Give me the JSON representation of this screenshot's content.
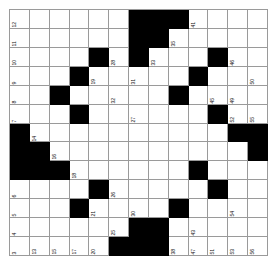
{
  "puzzle": {
    "title": "Crossword Grid",
    "rows": 13,
    "cols": 13,
    "colors": {
      "block": "#000000",
      "cell": "#ffffff",
      "gridline": "#9a9a9a",
      "number": "#111111",
      "background": "#ffffff"
    },
    "number_orientation": "rotated-90-ccw",
    "grid": [
      [
        "w",
        "w",
        "w",
        "w",
        "w",
        "w",
        "b",
        "b",
        "b",
        "w",
        "w",
        "w",
        "w"
      ],
      [
        "w",
        "w",
        "w",
        "w",
        "w",
        "w",
        "b",
        "b",
        "w",
        "w",
        "w",
        "w",
        "w"
      ],
      [
        "w",
        "w",
        "w",
        "w",
        "b",
        "w",
        "b",
        "w",
        "w",
        "w",
        "b",
        "w",
        "w"
      ],
      [
        "w",
        "w",
        "w",
        "b",
        "w",
        "w",
        "w",
        "w",
        "w",
        "b",
        "w",
        "w",
        "w"
      ],
      [
        "w",
        "w",
        "b",
        "w",
        "w",
        "w",
        "w",
        "w",
        "b",
        "w",
        "w",
        "w",
        "w"
      ],
      [
        "w",
        "w",
        "w",
        "b",
        "w",
        "w",
        "w",
        "w",
        "w",
        "w",
        "b",
        "w",
        "w"
      ],
      [
        "b",
        "w",
        "w",
        "w",
        "w",
        "w",
        "w",
        "w",
        "w",
        "w",
        "w",
        "b",
        "b"
      ],
      [
        "b",
        "b",
        "w",
        "w",
        "w",
        "w",
        "w",
        "w",
        "w",
        "w",
        "w",
        "w",
        "b"
      ],
      [
        "b",
        "b",
        "b",
        "w",
        "w",
        "w",
        "w",
        "w",
        "w",
        "b",
        "w",
        "w",
        "w"
      ],
      [
        "w",
        "w",
        "w",
        "w",
        "b",
        "w",
        "w",
        "w",
        "w",
        "w",
        "b",
        "w",
        "w"
      ],
      [
        "w",
        "w",
        "w",
        "b",
        "w",
        "w",
        "w",
        "w",
        "b",
        "w",
        "w",
        "w",
        "w"
      ],
      [
        "w",
        "w",
        "w",
        "w",
        "w",
        "w",
        "b",
        "b",
        "w",
        "w",
        "w",
        "w",
        "w"
      ],
      [
        "w",
        "w",
        "w",
        "w",
        "w",
        "b",
        "b",
        "b",
        "w",
        "w",
        "w",
        "w",
        "w"
      ]
    ],
    "numbers": [
      {
        "row": 0,
        "col": 0,
        "n": "12"
      },
      {
        "row": 0,
        "col": 9,
        "n": "41"
      },
      {
        "row": 1,
        "col": 0,
        "n": "11"
      },
      {
        "row": 1,
        "col": 8,
        "n": "35"
      },
      {
        "row": 2,
        "col": 0,
        "n": "10"
      },
      {
        "row": 2,
        "col": 5,
        "n": "28"
      },
      {
        "row": 2,
        "col": 7,
        "n": "33"
      },
      {
        "row": 2,
        "col": 11,
        "n": "46"
      },
      {
        "row": 3,
        "col": 0,
        "n": "9"
      },
      {
        "row": 3,
        "col": 4,
        "n": "19"
      },
      {
        "row": 3,
        "col": 6,
        "n": "31"
      },
      {
        "row": 3,
        "col": 9,
        "n": "40"
      },
      {
        "row": 3,
        "col": 12,
        "n": "50"
      },
      {
        "row": 4,
        "col": 0,
        "n": "8"
      },
      {
        "row": 4,
        "col": 5,
        "n": "32"
      },
      {
        "row": 4,
        "col": 10,
        "n": "45"
      },
      {
        "row": 4,
        "col": 11,
        "n": "49"
      },
      {
        "row": 5,
        "col": 0,
        "n": "7"
      },
      {
        "row": 5,
        "col": 6,
        "n": "27"
      },
      {
        "row": 5,
        "col": 11,
        "n": "52"
      },
      {
        "row": 5,
        "col": 12,
        "n": "55"
      },
      {
        "row": 6,
        "col": 1,
        "n": "14"
      },
      {
        "row": 7,
        "col": 2,
        "n": "16"
      },
      {
        "row": 8,
        "col": 3,
        "n": "18"
      },
      {
        "row": 8,
        "col": 9,
        "n": "44"
      },
      {
        "row": 9,
        "col": 0,
        "n": "6"
      },
      {
        "row": 9,
        "col": 4,
        "n": "22"
      },
      {
        "row": 9,
        "col": 5,
        "n": "26"
      },
      {
        "row": 9,
        "col": 10,
        "n": "48"
      },
      {
        "row": 10,
        "col": 0,
        "n": "5"
      },
      {
        "row": 10,
        "col": 4,
        "n": "21"
      },
      {
        "row": 10,
        "col": 6,
        "n": "30"
      },
      {
        "row": 10,
        "col": 8,
        "n": "39"
      },
      {
        "row": 10,
        "col": 11,
        "n": "54"
      },
      {
        "row": 11,
        "col": 0,
        "n": "4"
      },
      {
        "row": 11,
        "col": 5,
        "n": "25"
      },
      {
        "row": 11,
        "col": 7,
        "n": "34"
      },
      {
        "row": 11,
        "col": 9,
        "n": "43"
      },
      {
        "row": 12,
        "col": 0,
        "n": "3"
      },
      {
        "row": 12,
        "col": 6,
        "n": "23"
      },
      {
        "row": 12,
        "col": 8,
        "n": "38"
      }
    ],
    "edge_numbers_bottom": [
      "1",
      "13",
      "15",
      "17",
      "20",
      "24",
      "29",
      "36",
      "42",
      "47",
      "51",
      "53",
      "56"
    ],
    "edge_numbers_extra": [
      "2",
      "37",
      "57",
      "47",
      "51"
    ],
    "number_range": {
      "min": 1,
      "max": 57
    }
  }
}
